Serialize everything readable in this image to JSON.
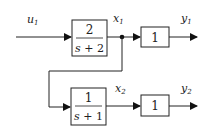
{
  "diagram": {
    "type": "block-diagram",
    "signals": {
      "input": {
        "name": "u",
        "sub": "1"
      },
      "x1": {
        "name": "x",
        "sub": "1"
      },
      "x2": {
        "name": "x",
        "sub": "2"
      },
      "y1": {
        "name": "y",
        "sub": "1"
      },
      "y2": {
        "name": "y",
        "sub": "2"
      }
    },
    "blocks": [
      {
        "id": "G1",
        "numerator": "2",
        "denominator_var": "s",
        "denominator_rest": " + 2"
      },
      {
        "id": "K1",
        "gain": "1"
      },
      {
        "id": "G2",
        "numerator": "1",
        "denominator_var": "s",
        "denominator_rest": " + 1"
      },
      {
        "id": "K2",
        "gain": "1"
      }
    ],
    "connections": [
      {
        "from": "u1",
        "to": "G1"
      },
      {
        "from": "G1",
        "to": "x1"
      },
      {
        "from": "x1",
        "to": "K1"
      },
      {
        "from": "K1",
        "to": "y1"
      },
      {
        "from": "x1",
        "to": "G2",
        "note": "branch point"
      },
      {
        "from": "G2",
        "to": "x2"
      },
      {
        "from": "x2",
        "to": "K2"
      },
      {
        "from": "K2",
        "to": "y2"
      }
    ]
  }
}
